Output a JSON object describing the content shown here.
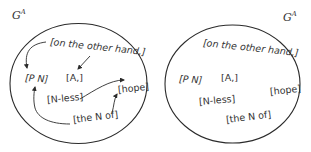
{
  "diagram": {
    "left_panel": {
      "title": "G",
      "title_sup": "A",
      "nodes": {
        "on_the_other_hand": "[on the other hand,]",
        "p_n": "[P  N]",
        "a": "[A,]",
        "n_less": "[N-less]",
        "hope": "[hope]",
        "the_n_of": "[the N of]"
      },
      "edges": [
        {
          "from": "[on the other hand,]",
          "to": "[P  N]"
        },
        {
          "from": "[on the other hand,]",
          "to": "[A,]"
        },
        {
          "from": "[N-less]",
          "to": "[hope]"
        },
        {
          "from": "[the N of]",
          "to": "[P  N]"
        },
        {
          "from": "[the N of]",
          "to": "[hope]"
        }
      ]
    },
    "right_panel": {
      "title": "G",
      "title_sup": "A",
      "nodes": {
        "on_the_other_hand": "[on the other hand,]",
        "p_n": "[P N]",
        "a": "[A,]",
        "n_less": "[N-less]",
        "hope": "[hope]",
        "the_n_of": "[the N of]"
      }
    },
    "colors": {
      "stroke": "#2b2b2b",
      "text": "#333333",
      "background": "#ffffff"
    }
  }
}
